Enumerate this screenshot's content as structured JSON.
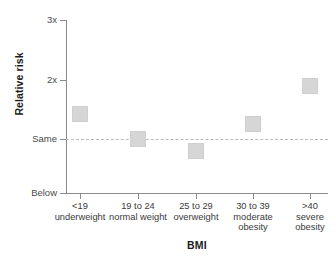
{
  "chart_data": {
    "type": "scatter",
    "title": "",
    "xlabel": "BMI",
    "ylabel": "Relative risk",
    "grid": false,
    "legend": "none",
    "categories": [
      "<19 underweight",
      "19 to 24 normal weight",
      "25 to 29 overweight",
      "30 to 39 moderate obesity",
      ">40 severe obesity"
    ],
    "values": [
      1.42,
      1.0,
      0.8,
      1.25,
      1.89
    ],
    "ytick_labels": [
      "3x",
      "2x",
      "Same",
      "Below"
    ],
    "ytick_values": [
      3,
      2,
      1,
      0
    ],
    "ylim": [
      0,
      3
    ],
    "reference_line": {
      "label": "Same",
      "value": 1,
      "style": "dashed"
    },
    "marker": {
      "shape": "square",
      "color": "#d6d6d6"
    }
  },
  "axes": {
    "y_title": "Relative risk",
    "x_title": "BMI",
    "y_ticks": [
      {
        "label": "3x"
      },
      {
        "label": "2x"
      },
      {
        "label": "Same"
      },
      {
        "label": "Below"
      }
    ],
    "x_categories": [
      {
        "line1": "<19",
        "line2": "underweight",
        "line3": ""
      },
      {
        "line1": "19 to 24",
        "line2": "normal weight",
        "line3": ""
      },
      {
        "line1": "25 to 29",
        "line2": "overweight",
        "line3": ""
      },
      {
        "line1": "30 to 39",
        "line2": "moderate",
        "line3": "obesity"
      },
      {
        "line1": ">40",
        "line2": "severe",
        "line3": "obesity"
      }
    ]
  }
}
